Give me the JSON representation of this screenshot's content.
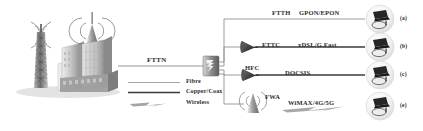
{
  "figure": {
    "type": "broadband-access-network-diagram",
    "backbone_label": "FTTN"
  },
  "legend": {
    "title": "",
    "items": [
      {
        "label": "Fibre",
        "style": "thin-gray-line",
        "color": "#8c8c8c"
      },
      {
        "label": "Copper/Coax",
        "style": "thick-black-line",
        "color": "#3a3a3a"
      },
      {
        "label": "Wireless",
        "style": "lightning-bolt",
        "color": "#9a9a9a"
      }
    ]
  },
  "source": {
    "tower_icon": "cell-tower-icon",
    "city_icon": "city-buildings-icon",
    "rooftop_antenna_icon": "rooftop-antenna-icon"
  },
  "node": {
    "icon": "network-switch-cabinet-icon",
    "label": ""
  },
  "branches": [
    {
      "index": "(a)",
      "access": "FTTH",
      "standard": "GPON/EPON",
      "link_type": "fibre",
      "mid_icon": "none",
      "cpe_icon": "customer-premises-devices-icon"
    },
    {
      "index": "(b)",
      "access": "FTTC",
      "standard": "xDSL/G.Fast",
      "link_type": "copper",
      "mid_icon": "street-cabinet-cone-icon",
      "cpe_icon": "customer-premises-devices-icon"
    },
    {
      "index": "(c)",
      "access": "HFC",
      "standard": "DOCSIS",
      "link_type": "coax",
      "mid_icon": "street-cabinet-cone-icon",
      "cpe_icon": "customer-premises-devices-icon"
    },
    {
      "index": "(e)",
      "access": "FWA",
      "standard": "WiMAX/4G/5G",
      "link_type": "wireless",
      "mid_icon": "wireless-antenna-icon",
      "cpe_icon": "customer-premises-devices-icon"
    }
  ],
  "colors": {
    "fibre_line": "#8c8c8c",
    "copper_line": "#3a3a3a",
    "wireless": "#9a9a9a",
    "text": "#2b2b2b",
    "icon_dark": "#2f2f2f",
    "icon_mid": "#7a7a7a",
    "icon_light": "#cfcfcf"
  }
}
